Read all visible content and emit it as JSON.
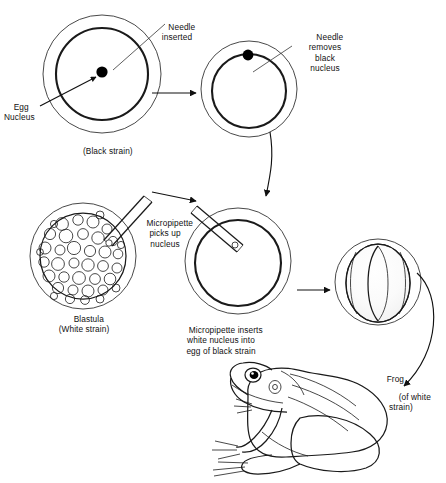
{
  "figure": {
    "domain": "diagram",
    "background_color": "#ffffff",
    "ink_color": "#1a1a1a"
  },
  "labels": {
    "needle_inserted": "Needle\ninserted",
    "egg_nucleus": "Egg\nNucleus",
    "black_strain": "(Black strain)",
    "needle_removes": "Needle\nremoves\nblack\nnucleus",
    "micropipette_picks_up": "Micropipette\npicks up\nnucleus",
    "blastula": "Blastula\n(White strain)",
    "micropipette_inserts": "Micropipette inserts\nwhite nucleus into\negg of black strain",
    "frog": "Frog",
    "of_white_strain": "(of white\nstrain)"
  },
  "stages": [
    {
      "id": "stage-1",
      "name": "black-strain-egg-with-nucleus",
      "caption": "(Black strain)",
      "annotations": [
        "Needle inserted",
        "Egg Nucleus"
      ],
      "nucleus_color": "#000000",
      "nucleus_state": "present"
    },
    {
      "id": "stage-2",
      "name": "black-strain-egg-nucleus-removed",
      "caption": "",
      "annotations": [
        "Needle removes black nucleus"
      ],
      "nucleus_color": "#000000",
      "nucleus_state": "being-removed"
    },
    {
      "id": "stage-3",
      "name": "white-strain-blastula",
      "caption": "Blastula (White strain)",
      "annotations": [
        "Micropipette picks up nucleus"
      ],
      "nucleus_state": "cells"
    },
    {
      "id": "stage-4",
      "name": "enucleated-egg-receiving-nucleus",
      "caption": "Micropipette inserts white nucleus into egg of black strain",
      "annotations": [],
      "nucleus_state": "receiving"
    },
    {
      "id": "stage-5",
      "name": "developing-embryo-neurula",
      "caption": "",
      "annotations": [],
      "nucleus_state": "embryo"
    },
    {
      "id": "stage-6",
      "name": "adult-frog",
      "caption": "Frog (of white strain)",
      "annotations": [],
      "nucleus_state": "adult"
    }
  ]
}
